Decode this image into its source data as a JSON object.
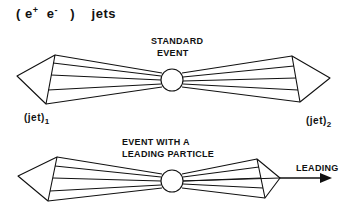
{
  "title": {
    "open": "(",
    "e_plus": "e",
    "plus_sup": "+",
    "e_minus": "e",
    "minus_sup": "-",
    "close": ")",
    "word": "jets"
  },
  "standard_event": {
    "line1": "STANDARD",
    "line2": "EVENT"
  },
  "leading_event": {
    "line1": "EVENT WITH A",
    "line2": "LEADING PARTICLE",
    "arrow_label": "LEADING"
  },
  "jet_labels": {
    "jet1": {
      "base": "(jet)",
      "sub": "1"
    },
    "jet2": {
      "base": "(jet)",
      "sub": "2"
    }
  }
}
